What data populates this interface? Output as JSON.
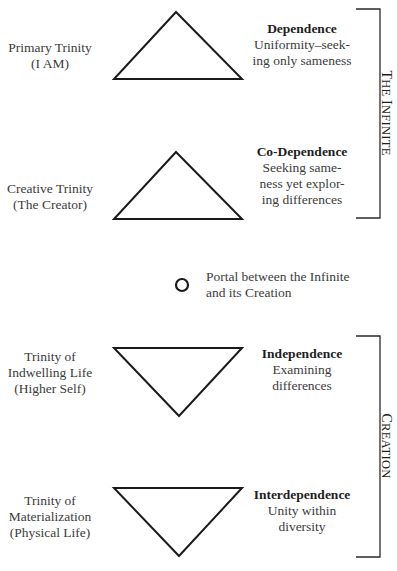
{
  "diagram": {
    "levels": [
      {
        "name": "Primary Trinity",
        "sub": "(I AM)",
        "orientation": "up",
        "title": "Dependence",
        "desc": [
          "Uniformity–seek-",
          "ing only sameness"
        ]
      },
      {
        "name": "Creative Trinity",
        "sub": "(The Creator)",
        "orientation": "up",
        "title": "Co-Dependence",
        "desc": [
          "Seeking same-",
          "ness yet explor-",
          "ing differences"
        ]
      },
      {
        "name": "Trinity of",
        "name2": "Indwelling Life",
        "sub": "(Higher Self)",
        "orientation": "down",
        "title": "Independence",
        "desc": [
          "Examining",
          "differences"
        ]
      },
      {
        "name": "Trinity of",
        "name2": "Materialization",
        "sub": "(Physical Life)",
        "orientation": "down",
        "title": "Interdependence",
        "desc": [
          "Unity within",
          "diversity"
        ]
      }
    ],
    "portal": {
      "lines": [
        "Portal between the Infinite",
        "and its Creation"
      ]
    },
    "groups": {
      "infinite": {
        "first": "T",
        "rest": "HE ",
        "first2": "I",
        "rest2": "NFINITE"
      },
      "creation": {
        "first": "C",
        "rest": "REATION"
      }
    }
  }
}
